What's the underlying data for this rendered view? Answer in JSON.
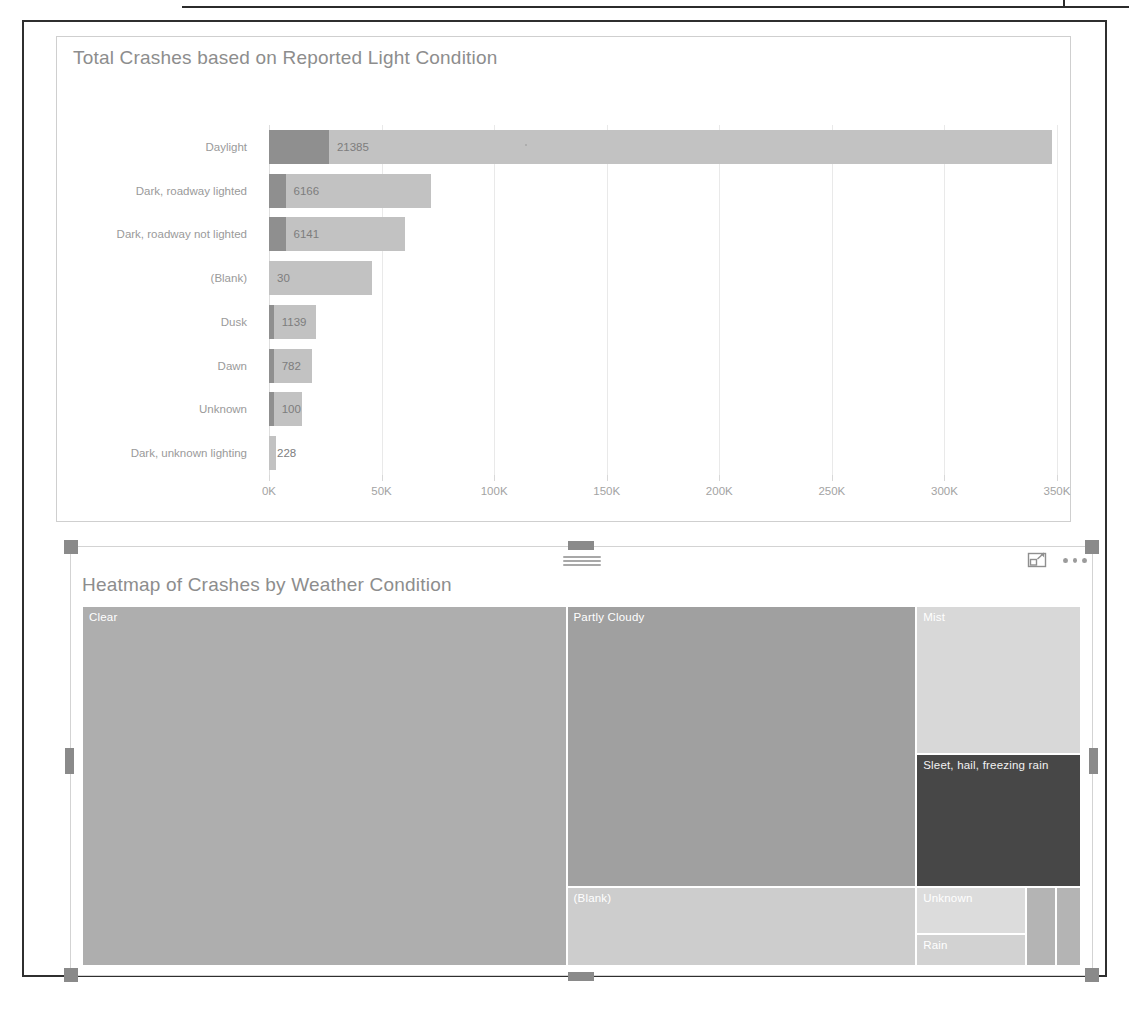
{
  "page": {
    "ghost_artifacts": [
      "",
      ""
    ]
  },
  "bar_visual": {
    "title": "Total Crashes based on Reported Light Condition",
    "axis_ticks": [
      "0K",
      "50K",
      "100K",
      "150K",
      "200K",
      "250K",
      "300K",
      "350K"
    ]
  },
  "tree_visual": {
    "title": "Heatmap of Crashes by Weather Condition",
    "toolbar": {
      "focus_mode_label": "focus-mode",
      "more_options_label": "more-options"
    }
  },
  "chart_data": [
    {
      "type": "bar",
      "title": "Total Crashes based on Reported Light Condition",
      "orientation": "horizontal",
      "xlabel": "",
      "ylabel": "",
      "xlim": [
        0,
        350000
      ],
      "grid": true,
      "tick_labels": [
        "0K",
        "50K",
        "100K",
        "150K",
        "200K",
        "250K",
        "300K",
        "350K"
      ],
      "tick_values": [
        0,
        50000,
        100000,
        150000,
        200000,
        250000,
        300000,
        350000
      ],
      "categories": [
        "Daylight",
        "Dark, roadway lighted",
        "Dark, roadway not lighted",
        "(Blank)",
        "Dusk",
        "Dawn",
        "Unknown",
        "Dark, unknown lighting"
      ],
      "values": [
        348000,
        72000,
        60000,
        46000,
        21000,
        19000,
        15000,
        3000
      ],
      "data_labels": [
        "21385",
        "6166",
        "6141",
        "30",
        "1139",
        "782",
        "100",
        "228"
      ],
      "segment_values": [
        21385,
        6166,
        6141,
        30,
        1139,
        782,
        100,
        228
      ],
      "series": [
        {
          "name": "highlighted",
          "values": [
            21385,
            6166,
            6141,
            30,
            1139,
            782,
            100,
            228
          ],
          "color": "#8f8f8f"
        },
        {
          "name": "total",
          "values": [
            348000,
            72000,
            60000,
            46000,
            21000,
            19000,
            15000,
            3000
          ],
          "color": "#c2c2c2"
        }
      ]
    },
    {
      "type": "treemap",
      "title": "Heatmap of Crashes by Weather Condition",
      "labels": [
        "Clear",
        "Partly Cloudy",
        "Mist",
        "Sleet, hail, freezing rain",
        "(Blank)",
        "Unknown",
        "Rain",
        "",
        ""
      ],
      "values": [
        49,
        22,
        10,
        7,
        6.5,
        2.6,
        1.7,
        0.7,
        0.5
      ],
      "colors": [
        "#aeaeae",
        "#a0a0a0",
        "#d8d8d8",
        "#474747",
        "#cdcdcd",
        "#dcdcdc",
        "#d2d2d2",
        "#b4b4b4",
        "#b4b4b4"
      ]
    }
  ],
  "bars": [
    {
      "label": "Daylight",
      "value": "21385",
      "total_pct": 99.4,
      "seg_pct": 7.6
    },
    {
      "label": "Dark, roadway lighted",
      "value": "6166",
      "total_pct": 20.6,
      "seg_pct": 2.1
    },
    {
      "label": "Dark, roadway not lighted",
      "value": "6141",
      "total_pct": 17.3,
      "seg_pct": 2.1
    },
    {
      "label": "(Blank)",
      "value": "30",
      "total_pct": 13.1,
      "seg_pct": 0.0
    },
    {
      "label": "Dusk",
      "value": "1139",
      "total_pct": 6.0,
      "seg_pct": 0.6
    },
    {
      "label": "Dawn",
      "value": "782",
      "total_pct": 5.4,
      "seg_pct": 0.6
    },
    {
      "label": "Unknown",
      "value": "100",
      "total_pct": 4.2,
      "seg_pct": 0.6
    },
    {
      "label": "Dark, unknown lighting",
      "value": "228",
      "total_pct": 0.9,
      "seg_pct": 0.0
    }
  ],
  "tiles": [
    {
      "name": "Clear",
      "color": "#aeaeae"
    },
    {
      "name": "Partly Cloudy",
      "color": "#a0a0a0"
    },
    {
      "name": "(Blank)",
      "color": "#cdcdcd"
    },
    {
      "name": "Mist",
      "color": "#d8d8d8"
    },
    {
      "name": "Sleet, hail, freezing rain",
      "color": "#474747"
    },
    {
      "name": "Unknown",
      "color": "#dcdcdc"
    },
    {
      "name": "Rain",
      "color": "#d2d2d2"
    },
    {
      "name": "",
      "color": "#b4b4b4"
    },
    {
      "name": "",
      "color": "#b4b4b4"
    }
  ]
}
